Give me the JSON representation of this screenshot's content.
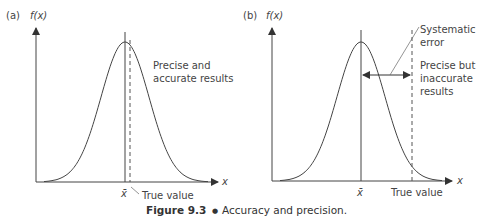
{
  "panels": [
    {
      "id": "a",
      "panel_label": "(a)",
      "y_axis_label": "f(x)",
      "x_axis_label": "x",
      "mean_label": "x̄",
      "true_value_label": "True value",
      "annotation_lines": [
        "Precise and",
        "accurate results"
      ]
    },
    {
      "id": "b",
      "panel_label": "(b)",
      "y_axis_label": "f(x)",
      "x_axis_label": "x",
      "mean_label": "x̄",
      "true_value_label": "True value",
      "systematic_error_lines": [
        "Systematic",
        "error"
      ],
      "annotation_lines": [
        "Precise but",
        "inaccurate",
        "results"
      ]
    }
  ],
  "caption": {
    "number": "Figure 9.3",
    "bullet": "●",
    "text": "Accuracy and precision."
  }
}
